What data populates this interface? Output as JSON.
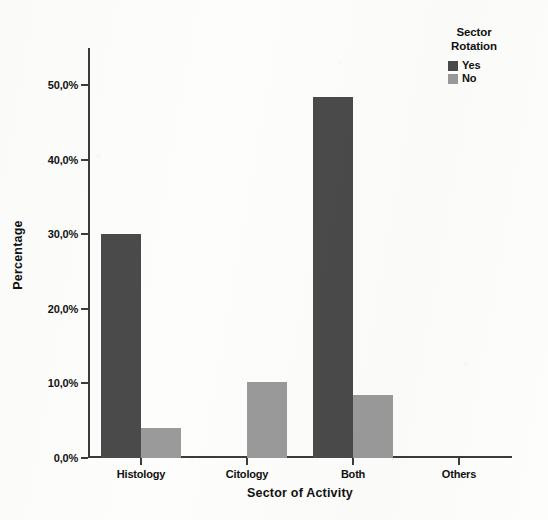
{
  "chart_data": {
    "type": "bar",
    "title": "",
    "xlabel": "Sector of Activity",
    "ylabel": "Percentage",
    "categories": [
      "Histology",
      "Citology",
      "Both",
      "Others"
    ],
    "series": [
      {
        "name": "Yes",
        "color": "#4a4a4a",
        "values": [
          30.0,
          0.0,
          48.4,
          0.0
        ]
      },
      {
        "name": "No",
        "color": "#9a9a9a",
        "values": [
          4.0,
          10.2,
          8.4,
          0.0
        ]
      }
    ],
    "ylim": [
      0,
      55
    ],
    "ytick_values": [
      0,
      10,
      20,
      30,
      40,
      50
    ],
    "ytick_labels": [
      "0,0%",
      "10,0%",
      "20,0%",
      "30,0%",
      "40,0%",
      "50,0%"
    ],
    "grid": false,
    "legend_position": "top-right",
    "legend": {
      "title_line1": "Sector",
      "title_line2": "Rotation",
      "entries": [
        "Yes",
        "No"
      ]
    }
  }
}
